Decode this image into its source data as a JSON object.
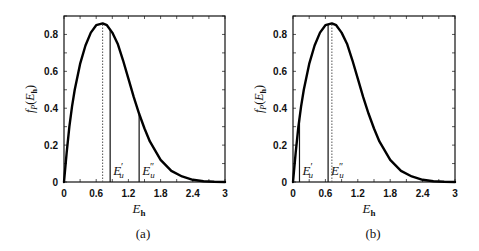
{
  "chart_data": [
    {
      "type": "line",
      "panel_caption": "(a)",
      "xlabel": "E",
      "xlabel_sub": "h",
      "ylabel": "f",
      "ylabel_sub": "P",
      "ylabel_arg": "E",
      "ylabel_arg_sub": "h",
      "xlim": [
        0,
        3
      ],
      "ylim": [
        0,
        0.9
      ],
      "xticks": [
        0,
        0.6,
        1.2,
        1.8,
        2.4,
        3
      ],
      "xtick_labels": [
        "0",
        "0.6",
        "1.2",
        "1.8",
        "2.4",
        "3"
      ],
      "yticks": [
        0,
        0.2,
        0.4,
        0.6,
        0.8
      ],
      "ytick_labels": [
        "0",
        "0.2",
        "0.4",
        "0.6",
        "0.8"
      ],
      "grid": false,
      "series": [
        {
          "name": "pdf",
          "x": [
            0,
            0.05,
            0.1,
            0.15,
            0.2,
            0.3,
            0.4,
            0.5,
            0.6,
            0.72,
            0.8,
            0.9,
            1.0,
            1.1,
            1.2,
            1.3,
            1.4,
            1.5,
            1.6,
            1.8,
            2.0,
            2.2,
            2.4,
            2.6,
            2.8,
            3.0
          ],
          "y": [
            0,
            0.16,
            0.3,
            0.41,
            0.5,
            0.64,
            0.74,
            0.81,
            0.85,
            0.86,
            0.85,
            0.81,
            0.75,
            0.66,
            0.56,
            0.46,
            0.37,
            0.29,
            0.22,
            0.12,
            0.06,
            0.03,
            0.012,
            0.004,
            0.001,
            0
          ]
        }
      ],
      "vlines": [
        {
          "name": "mode",
          "x": 0.72,
          "style": "dotted",
          "label": ""
        },
        {
          "name": "E-u-prime",
          "x": 0.86,
          "style": "solid",
          "label": "E",
          "label_sub": "u",
          "label_prime": "′"
        },
        {
          "name": "E-u-double-prime",
          "x": 1.4,
          "style": "solid",
          "label": "E",
          "label_sub": "u",
          "label_prime": "″"
        }
      ]
    },
    {
      "type": "line",
      "panel_caption": "(b)",
      "xlabel": "E",
      "xlabel_sub": "h",
      "ylabel": "f",
      "ylabel_sub": "P",
      "ylabel_arg": "E",
      "ylabel_arg_sub": "h",
      "xlim": [
        0,
        3
      ],
      "ylim": [
        0,
        0.9
      ],
      "xticks": [
        0,
        0.6,
        1.2,
        1.8,
        2.4,
        3
      ],
      "xtick_labels": [
        "0",
        "0.6",
        "1.2",
        "1.8",
        "2.4",
        "3"
      ],
      "yticks": [
        0,
        0.2,
        0.4,
        0.6,
        0.8
      ],
      "ytick_labels": [
        "0",
        "0.2",
        "0.4",
        "0.6",
        "0.8"
      ],
      "grid": false,
      "series": [
        {
          "name": "pdf",
          "x": [
            0,
            0.05,
            0.1,
            0.15,
            0.2,
            0.3,
            0.4,
            0.5,
            0.6,
            0.72,
            0.8,
            0.9,
            1.0,
            1.1,
            1.2,
            1.3,
            1.4,
            1.5,
            1.6,
            1.8,
            2.0,
            2.2,
            2.4,
            2.6,
            2.8,
            3.0
          ],
          "y": [
            0,
            0.16,
            0.3,
            0.41,
            0.5,
            0.64,
            0.74,
            0.81,
            0.85,
            0.86,
            0.85,
            0.81,
            0.75,
            0.66,
            0.56,
            0.46,
            0.37,
            0.29,
            0.22,
            0.12,
            0.06,
            0.03,
            0.012,
            0.004,
            0.001,
            0
          ]
        }
      ],
      "vlines": [
        {
          "name": "E-u-prime",
          "x": 0.12,
          "style": "solid",
          "label": "E",
          "label_sub": "u",
          "label_prime": "′"
        },
        {
          "name": "E-u-double-prime",
          "x": 0.65,
          "style": "solid",
          "label": "E",
          "label_sub": "u",
          "label_prime": "″"
        },
        {
          "name": "mode",
          "x": 0.72,
          "style": "dotted",
          "label": ""
        }
      ]
    }
  ]
}
